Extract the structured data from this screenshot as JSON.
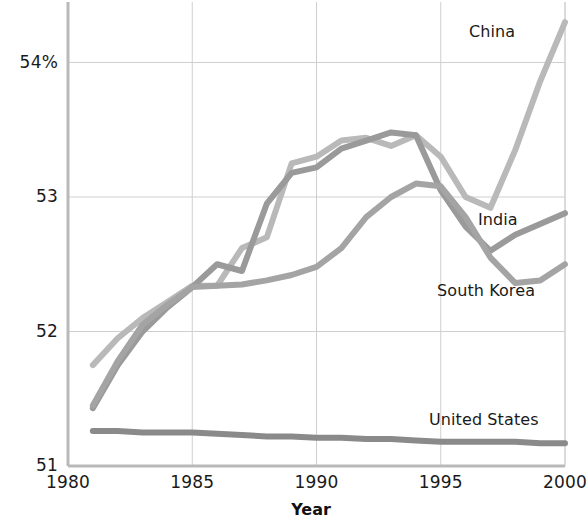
{
  "chart_data": {
    "type": "line",
    "title": "",
    "subtitle": "",
    "xlabel": "Year",
    "ylabel": "",
    "xlim": [
      1980,
      2000
    ],
    "ylim": [
      51,
      54.45
    ],
    "grid": true,
    "legend_position": "inline-end-labels",
    "x_ticks": [
      "1980",
      "1985",
      "1990",
      "1995",
      "2000"
    ],
    "x_tick_values": [
      1980,
      1985,
      1990,
      1995,
      2000
    ],
    "y_ticks": [
      "51",
      "52",
      "53",
      "54%"
    ],
    "y_tick_values": [
      51,
      52,
      53,
      54
    ],
    "x": [
      1981,
      1982,
      1983,
      1984,
      1985,
      1986,
      1987,
      1988,
      1989,
      1990,
      1991,
      1992,
      1993,
      1994,
      1995,
      1996,
      1997,
      1998,
      1999,
      2000
    ],
    "series": [
      {
        "name": "China",
        "color": "#b9b9b9",
        "label_x": 2000,
        "values": [
          51.75,
          51.95,
          52.1,
          52.22,
          52.34,
          52.34,
          52.62,
          52.7,
          53.25,
          53.3,
          53.42,
          53.44,
          53.38,
          53.46,
          53.3,
          53.0,
          52.92,
          53.35,
          53.86,
          54.3
        ]
      },
      {
        "name": "India",
        "color": "#9a9a9a",
        "label_x": 1997,
        "values": [
          51.43,
          51.75,
          52.0,
          52.18,
          52.33,
          52.5,
          52.45,
          52.95,
          53.18,
          53.22,
          53.36,
          53.42,
          53.48,
          53.46,
          53.05,
          52.78,
          52.6,
          52.72,
          52.8,
          52.88
        ]
      },
      {
        "name": "South Korea",
        "color": "#a4a4a4",
        "label_x": 1997,
        "values": [
          51.45,
          51.78,
          52.05,
          52.2,
          52.33,
          52.34,
          52.35,
          52.38,
          52.42,
          52.48,
          52.62,
          52.85,
          53.0,
          53.1,
          53.08,
          52.85,
          52.55,
          52.36,
          52.38,
          52.5
        ]
      },
      {
        "name": "United States",
        "color": "#8a8a8a",
        "label_x": 1996,
        "values": [
          51.26,
          51.26,
          51.25,
          51.25,
          51.25,
          51.24,
          51.23,
          51.22,
          51.22,
          51.21,
          51.21,
          51.2,
          51.2,
          51.19,
          51.18,
          51.18,
          51.18,
          51.18,
          51.17,
          51.17
        ]
      }
    ],
    "annotations": [
      {
        "text": "China",
        "x_px": 469,
        "y_px": 22,
        "series": "China"
      },
      {
        "text": "India",
        "x_px": 478,
        "y_px": 210,
        "series": "India"
      },
      {
        "text": "South Korea",
        "x_px": 437,
        "y_px": 281,
        "series": "South Korea"
      },
      {
        "text": "United States",
        "x_px": 429,
        "y_px": 410,
        "series": "United States"
      }
    ],
    "colors": {
      "grid": "#cfcfcf",
      "axis": "#c4c4c4",
      "text": "#1a1a1a",
      "background": "#ffffff"
    }
  }
}
